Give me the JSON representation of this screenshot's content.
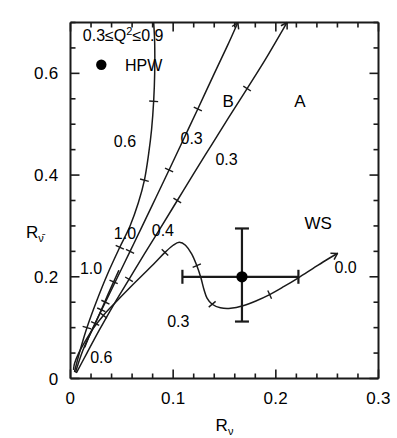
{
  "chart_data": {
    "type": "line",
    "title": "",
    "xlabel": "R_nu",
    "xlabel_base": "R",
    "xlabel_sub": "ν",
    "ylabel_base": "R",
    "ylabel_sub": "ν̄",
    "xlim": [
      0.0,
      0.3
    ],
    "ylim": [
      0.0,
      0.7
    ],
    "grid": false,
    "x_major_ticks": [
      0.0,
      0.1,
      0.2,
      0.3
    ],
    "x_major_labels": [
      "0",
      "0.1",
      "0.2",
      "0.3"
    ],
    "x_minor_step": 0.02,
    "y_major_ticks": [
      0.0,
      0.2,
      0.4,
      0.6
    ],
    "y_major_labels": [
      "0",
      "0.2",
      "0.4",
      "0.6"
    ],
    "y_minor_step": 0.05,
    "legend_position": "top-left",
    "annotations": [
      {
        "name": "kinematic-range",
        "text": "0.3≤Q²≤0.9",
        "x": 0.012,
        "y": 0.675
      },
      {
        "name": "hpw-legend",
        "text": "HPW",
        "x": 0.053,
        "y": 0.615
      },
      {
        "name": "curve-label-B",
        "text": "B",
        "x": 0.148,
        "y": 0.545
      },
      {
        "name": "curve-label-A",
        "text": "A",
        "x": 0.218,
        "y": 0.545
      },
      {
        "name": "curve-label-WS",
        "text": "WS",
        "x": 0.228,
        "y": 0.305
      }
    ],
    "series": [
      {
        "name": "curve-C-steep",
        "label_points": [
          {
            "text": "0.6",
            "x": 0.053,
            "y": 0.465
          },
          {
            "text": "1.0",
            "x": 0.053,
            "y": 0.285
          }
        ],
        "points": [
          [
            0.004,
            0.014
          ],
          [
            0.006,
            0.03
          ],
          [
            0.01,
            0.06
          ],
          [
            0.016,
            0.1
          ],
          [
            0.025,
            0.15
          ],
          [
            0.036,
            0.205
          ],
          [
            0.048,
            0.258
          ],
          [
            0.058,
            0.3
          ],
          [
            0.066,
            0.345
          ],
          [
            0.072,
            0.39
          ],
          [
            0.076,
            0.44
          ],
          [
            0.079,
            0.49
          ],
          [
            0.081,
            0.545
          ],
          [
            0.082,
            0.6
          ],
          [
            0.082,
            0.66
          ],
          [
            0.081,
            0.7
          ]
        ],
        "tick_params": [
          "1.0",
          "0.6"
        ]
      },
      {
        "name": "curve-B",
        "label_points": [
          {
            "text": "0.4",
            "x": 0.09,
            "y": 0.29
          },
          {
            "text": "0.3",
            "x": 0.118,
            "y": 0.47
          }
        ],
        "points": [
          [
            0.005,
            0.013
          ],
          [
            0.012,
            0.055
          ],
          [
            0.022,
            0.1
          ],
          [
            0.034,
            0.15
          ],
          [
            0.046,
            0.2
          ],
          [
            0.058,
            0.25
          ],
          [
            0.07,
            0.3
          ],
          [
            0.083,
            0.355
          ],
          [
            0.096,
            0.41
          ],
          [
            0.11,
            0.47
          ],
          [
            0.124,
            0.53
          ],
          [
            0.139,
            0.595
          ],
          [
            0.153,
            0.655
          ],
          [
            0.163,
            0.7
          ]
        ],
        "tick_params": [
          "0.4",
          "0.3"
        ]
      },
      {
        "name": "curve-A",
        "label_points": [
          {
            "text": "0.3",
            "x": 0.152,
            "y": 0.43
          }
        ],
        "points": [
          [
            0.006,
            0.012
          ],
          [
            0.016,
            0.05
          ],
          [
            0.028,
            0.095
          ],
          [
            0.042,
            0.145
          ],
          [
            0.057,
            0.195
          ],
          [
            0.072,
            0.245
          ],
          [
            0.088,
            0.297
          ],
          [
            0.104,
            0.35
          ],
          [
            0.12,
            0.403
          ],
          [
            0.137,
            0.458
          ],
          [
            0.154,
            0.513
          ],
          [
            0.172,
            0.57
          ],
          [
            0.19,
            0.628
          ],
          [
            0.208,
            0.69
          ],
          [
            0.211,
            0.7
          ]
        ],
        "tick_params": [
          "0.3"
        ]
      },
      {
        "name": "curve-left-short",
        "label_points": [
          {
            "text": "1.0",
            "x": 0.02,
            "y": 0.215
          }
        ],
        "points": [
          [
            0.014,
            0.062
          ],
          [
            0.018,
            0.082
          ],
          [
            0.024,
            0.108
          ],
          [
            0.03,
            0.135
          ],
          [
            0.036,
            0.163
          ],
          [
            0.042,
            0.19
          ],
          [
            0.047,
            0.212
          ]
        ],
        "tick_params": [
          "1.0"
        ]
      },
      {
        "name": "curve-WS",
        "label_points": [
          {
            "text": "0.6",
            "x": 0.03,
            "y": 0.04
          },
          {
            "text": "0.3",
            "x": 0.105,
            "y": 0.112
          },
          {
            "text": "0.0",
            "x": 0.268,
            "y": 0.218
          }
        ],
        "points": [
          [
            0.003,
            0.018
          ],
          [
            0.004,
            0.03
          ],
          [
            0.008,
            0.05
          ],
          [
            0.014,
            0.072
          ],
          [
            0.022,
            0.098
          ],
          [
            0.032,
            0.124
          ],
          [
            0.044,
            0.15
          ],
          [
            0.057,
            0.177
          ],
          [
            0.07,
            0.203
          ],
          [
            0.082,
            0.227
          ],
          [
            0.092,
            0.248
          ],
          [
            0.1,
            0.262
          ],
          [
            0.106,
            0.268
          ],
          [
            0.112,
            0.262
          ],
          [
            0.118,
            0.245
          ],
          [
            0.123,
            0.222
          ],
          [
            0.127,
            0.198
          ],
          [
            0.13,
            0.175
          ],
          [
            0.133,
            0.158
          ],
          [
            0.138,
            0.146
          ],
          [
            0.146,
            0.139
          ],
          [
            0.156,
            0.138
          ],
          [
            0.168,
            0.143
          ],
          [
            0.18,
            0.152
          ],
          [
            0.194,
            0.165
          ],
          [
            0.208,
            0.181
          ],
          [
            0.222,
            0.198
          ],
          [
            0.236,
            0.216
          ],
          [
            0.25,
            0.234
          ],
          [
            0.26,
            0.246
          ]
        ],
        "tick_params": [
          "0.6",
          "0.3",
          "0.0"
        ]
      }
    ],
    "data_point": {
      "name": "HPW",
      "x": 0.167,
      "y": 0.2,
      "xerr_low": 0.058,
      "xerr_high": 0.055,
      "yerr_low": 0.088,
      "yerr_high": 0.095,
      "marker": "filled-circle",
      "color": "#000000"
    }
  }
}
